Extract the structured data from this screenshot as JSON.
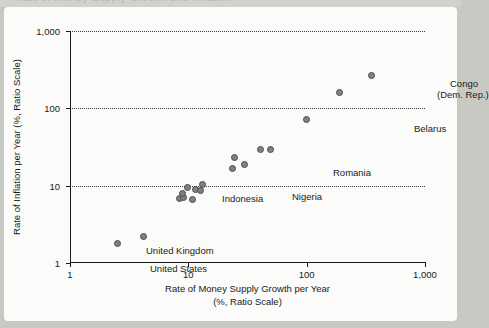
{
  "scan": {
    "top_remnant_text": "Rate of Money Supply Growth and Inflation"
  },
  "chart_data": {
    "type": "scatter",
    "title": "",
    "xlabel_line1": "Rate of Money Supply Growth per Year",
    "xlabel_line2": "(%, Ratio Scale)",
    "ylabel": "Rate of Inflation per Year (%, Ratio Scale)",
    "xscale": "log",
    "yscale": "log",
    "xlim": [
      1,
      1000
    ],
    "ylim": [
      1,
      1000
    ],
    "xticks": [
      1,
      10,
      100,
      1000
    ],
    "xticklabels": [
      "1",
      "10",
      "100",
      "1,000"
    ],
    "yticks": [
      1,
      10,
      100,
      1000
    ],
    "yticklabels": [
      "1",
      "10",
      "100",
      "1,000"
    ],
    "grid": "horizontal-dotted",
    "legend": "none",
    "marker_color": "#808080",
    "marker_edge_color": "#4d4d4d",
    "points": [
      {
        "label": "United States",
        "x": 2.5,
        "y": 1.8
      },
      {
        "label": "United Kingdom",
        "x": 4.2,
        "y": 2.2
      },
      {
        "label": "",
        "x": 8.5,
        "y": 6.8
      },
      {
        "label": "",
        "x": 9.1,
        "y": 7.1
      },
      {
        "label": "",
        "x": 9.0,
        "y": 8.0
      },
      {
        "label": "",
        "x": 9.9,
        "y": 9.6
      },
      {
        "label": "",
        "x": 10.8,
        "y": 6.7
      },
      {
        "label": "",
        "x": 11.5,
        "y": 8.8
      },
      {
        "label": "",
        "x": 12.6,
        "y": 8.6
      },
      {
        "label": "Indonesia",
        "x": 13.2,
        "y": 10.5
      },
      {
        "label": "Nigeria",
        "x": 23.5,
        "y": 16.5
      },
      {
        "label": "",
        "x": 24.5,
        "y": 23.0
      },
      {
        "label": "",
        "x": 30.0,
        "y": 19.0
      },
      {
        "label": "",
        "x": 41.0,
        "y": 29.0
      },
      {
        "label": "Romania",
        "x": 49.0,
        "y": 29.5
      },
      {
        "label": "",
        "x": 100.0,
        "y": 72.0
      },
      {
        "label": "Belarus",
        "x": 190.0,
        "y": 160.0
      },
      {
        "label": "Congo (Dem. Rep.)",
        "x": 350.0,
        "y": 265.0
      }
    ],
    "annotations": [
      {
        "name": "united-states",
        "text": "United States",
        "x_px": 80,
        "y_px": 232
      },
      {
        "name": "united-kingdom",
        "text": "United Kingdom",
        "x_px": 76,
        "y_px": 214
      },
      {
        "name": "indonesia",
        "text": "Indonesia",
        "x_px": 152,
        "y_px": 162
      },
      {
        "name": "nigeria",
        "text": "Nigeria",
        "x_px": 222,
        "y_px": 160
      },
      {
        "name": "romania",
        "text": "Romania",
        "x_px": 263,
        "y_px": 136
      },
      {
        "name": "belarus",
        "text": "Belarus",
        "x_px": 344,
        "y_px": 92
      },
      {
        "name": "congo-line1",
        "text": "Congo",
        "x_px": 380,
        "y_px": 47
      },
      {
        "name": "congo-line2",
        "text": "(Dem. Rep.)",
        "x_px": 367,
        "y_px": 58
      }
    ]
  }
}
